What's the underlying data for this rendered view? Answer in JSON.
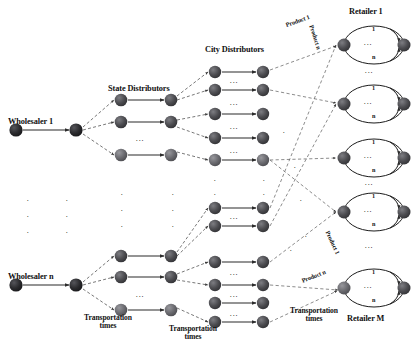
{
  "diagram": {
    "colors": {
      "node_dark": "#262626",
      "node_mid": "#4a4a4a",
      "node_light": "#6b6b6b",
      "edge_solid": "#2b2b2b",
      "edge_dashed": "#555555",
      "text": "#111111",
      "background": "#ffffff"
    },
    "labels": {
      "wholesaler_1": "Wholesaler 1",
      "wholesaler_n": "Wholesaler n",
      "state_distributors": "State Distributors",
      "city_distributors": "City Distributors",
      "retailer_1": "Retailer 1",
      "retailer_m": "Retailer M",
      "transportation_times_1": "Transportation",
      "transportation_times_1b": "times",
      "transportation_times_2": "Transportation",
      "transportation_times_2b": "times",
      "transportation_times_3": "Transportation",
      "transportation_times_3b": "times",
      "product_1_top": "Product 1",
      "product_n_top": "Product n",
      "product_1_bottom": "Product 1",
      "product_n_bottom": "Product n",
      "ellipsis_h": ". . .",
      "ellipsis_v": ".",
      "retailer_arc_top": "1",
      "retailer_arc_bottom": "n"
    },
    "columns": [
      {
        "name": "wholesalers",
        "count": 2,
        "label_key": "wholesaler"
      },
      {
        "name": "state-distributors",
        "count": 6,
        "label_key": "state_distributors"
      },
      {
        "name": "city-distributors",
        "count": 10,
        "label_key": "city_distributors"
      },
      {
        "name": "retailers",
        "count": 5,
        "label_key": "retailer"
      }
    ],
    "retailer_nodes": [
      {
        "label_top": "1",
        "label_bottom": "n",
        "center": ". . ."
      },
      {
        "label_top": "1",
        "label_bottom": "n",
        "center": ". . ."
      },
      {
        "label_top": "1",
        "label_bottom": "n",
        "center": ". . ."
      },
      {
        "label_top": "1",
        "label_bottom": "n",
        "center": ". . ."
      },
      {
        "label_top": "1",
        "label_bottom": "n",
        "center": ". . ."
      }
    ]
  }
}
